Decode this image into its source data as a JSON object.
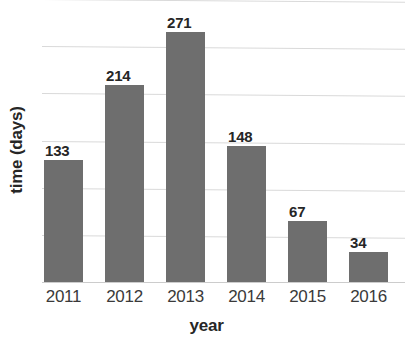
{
  "chart_data": {
    "type": "bar",
    "title": "",
    "xlabel": "year",
    "ylabel": "time (days)",
    "categories": [
      "2011",
      "2012",
      "2013",
      "2014",
      "2015",
      "2016"
    ],
    "values": [
      133,
      214,
      271,
      148,
      67,
      34
    ],
    "value_labels": [
      "133",
      "214",
      "271",
      "148",
      "67",
      "34"
    ],
    "ylim": [
      0,
      306
    ],
    "grid": true,
    "grid_axis": "y",
    "gridline_values": [
      51,
      102,
      153,
      204,
      255,
      306
    ],
    "y_tick_labels_visible": false,
    "legend": null,
    "legend_position": "none",
    "bar_color": "#6e6e6e",
    "gridline_color": "#d9d9d9",
    "text_color": "#262626",
    "background_color": "#ffffff"
  },
  "axes": {
    "x_title": "year",
    "y_title": "time (days)"
  }
}
